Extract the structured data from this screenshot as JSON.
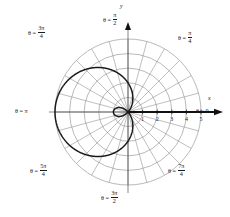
{
  "figure": {
    "axis_labels": {
      "x": "x",
      "y": "y"
    },
    "tick_labels_x": [
      "1",
      "2",
      "3",
      "4",
      "5"
    ],
    "angle_labels": [
      {
        "name": "theta-0",
        "prefix": "θ =",
        "whole": "0",
        "num": "",
        "den": ""
      },
      {
        "name": "theta-pi-4",
        "prefix": "θ =",
        "whole": "",
        "num": "π",
        "den": "4"
      },
      {
        "name": "theta-pi-2",
        "prefix": "θ =",
        "whole": "",
        "num": "π",
        "den": "2"
      },
      {
        "name": "theta-3pi-4",
        "prefix": "θ =",
        "whole": "",
        "num": "3π",
        "den": "4"
      },
      {
        "name": "theta-pi",
        "prefix": "θ =",
        "whole": "π",
        "num": "",
        "den": ""
      },
      {
        "name": "theta-5pi-4",
        "prefix": "θ =",
        "whole": "",
        "num": "5π",
        "den": "4"
      },
      {
        "name": "theta-3pi-2",
        "prefix": "θ =",
        "whole": "",
        "num": "3π",
        "den": "2"
      },
      {
        "name": "theta-7pi-4",
        "prefix": "θ =",
        "whole": "",
        "num": "7π",
        "den": "4"
      }
    ]
  },
  "chart_data": {
    "type": "line",
    "coordinate_system": "polar",
    "title": "",
    "xlabel": "x",
    "ylabel": "y",
    "curve_equation": "r = 2 - 3 cos(θ)",
    "curve_name": "limacon-with-inner-loop",
    "r_max": 5,
    "r_grid_circles": [
      1,
      2,
      3,
      4,
      5
    ],
    "theta_grid_step_deg": 15,
    "angle_tick_labels_deg": [
      0,
      45,
      90,
      135,
      180,
      225,
      270,
      315
    ],
    "angle_tick_labels": [
      "0",
      "π/4",
      "π/2",
      "3π/4",
      "π",
      "5π/4",
      "3π/2",
      "7π/4"
    ],
    "radial_tick_values": [
      1,
      2,
      3,
      4,
      5
    ],
    "radial_tick_labels": [
      "1",
      "2",
      "3",
      "4",
      "5"
    ],
    "grid": true,
    "legend": false,
    "series": [
      {
        "name": "r = 2 - 3 cos(θ)",
        "color": "#1a1a1a",
        "theta_deg": [
          0,
          10,
          20,
          30,
          40,
          50,
          60,
          70,
          80,
          90,
          100,
          110,
          120,
          130,
          140,
          150,
          160,
          170,
          180,
          190,
          200,
          210,
          220,
          230,
          240,
          250,
          260,
          270,
          280,
          290,
          300,
          310,
          320,
          330,
          340,
          350,
          360
        ],
        "r": [
          -1.0,
          -0.955,
          -0.819,
          -0.598,
          -0.298,
          0.072,
          0.5,
          0.974,
          1.479,
          2.0,
          2.521,
          3.026,
          3.5,
          3.928,
          4.298,
          4.598,
          4.819,
          4.955,
          5.0,
          4.955,
          4.819,
          4.598,
          4.298,
          3.928,
          3.5,
          3.026,
          2.521,
          2.0,
          1.479,
          0.974,
          0.5,
          0.072,
          -0.298,
          -0.598,
          -0.819,
          -0.955,
          -1.0
        ]
      }
    ],
    "features": {
      "max_radius_point": {
        "theta_deg": 180,
        "r": 5
      },
      "inner_loop_extent": {
        "theta_deg": 0,
        "r": -1,
        "cartesian_x": 1
      },
      "zeros_theta_deg": [
        48.19,
        311.81
      ]
    }
  }
}
